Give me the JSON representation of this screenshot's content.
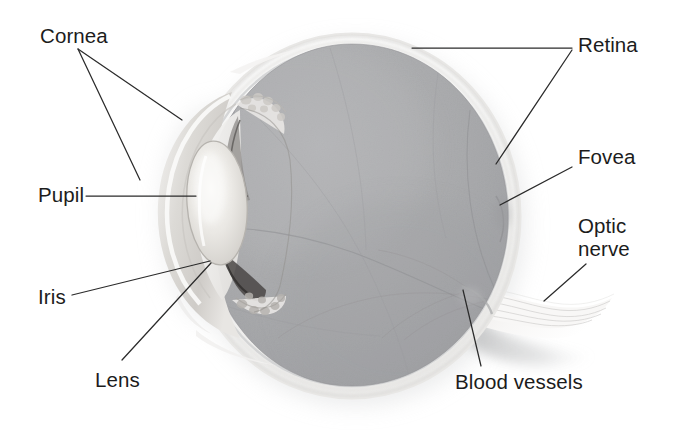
{
  "figure": {
    "type": "anatomical-illustration",
    "background_color": "#ffffff",
    "label_color": "#1c1c1c",
    "leader_line_color": "#2b2b2b"
  },
  "labels": [
    {
      "id": "cornea",
      "text": "Cornea",
      "x": 40,
      "y": 24,
      "align": "left",
      "leader_style": "forked",
      "leader_targets": "corneal dome (outer) and corneal rim (lower)"
    },
    {
      "id": "pupil",
      "text": "Pupil",
      "x": 38,
      "y": 183,
      "align": "left",
      "leader_style": "horizontal",
      "leader_targets": "central aperture of iris"
    },
    {
      "id": "iris",
      "text": "Iris",
      "x": 38,
      "y": 285,
      "align": "left",
      "leader_style": "straight",
      "leader_targets": "pigmented iris margin"
    },
    {
      "id": "lens",
      "text": "Lens",
      "x": 95,
      "y": 368,
      "align": "left",
      "leader_style": "straight",
      "leader_targets": "crystalline lens equator"
    },
    {
      "id": "retina",
      "text": "Retina",
      "x": 578,
      "y": 33,
      "align": "left",
      "leader_style": "forked",
      "leader_targets": "superior retinal wall and posterior retinal wall"
    },
    {
      "id": "fovea",
      "text": "Fovea",
      "x": 578,
      "y": 145,
      "align": "left",
      "leader_style": "straight",
      "leader_targets": "foveal depression at posterior pole"
    },
    {
      "id": "optic-nerve",
      "text": "Optic\nnerve",
      "x": 578,
      "y": 215,
      "align": "left",
      "leader_style": "straight",
      "leader_targets": "optic nerve trunk"
    },
    {
      "id": "blood-vessels",
      "text": "Blood vessels",
      "x": 455,
      "y": 370,
      "align": "left",
      "leader_style": "straight",
      "leader_targets": "vessels at the optic disc"
    }
  ],
  "anatomy": {
    "globe": {
      "center_x": 352,
      "center_y": 216,
      "radius_x": 168,
      "radius_y": 182,
      "vitreous_color": "#a9aaac",
      "sclera_color": "#f3f3f2"
    },
    "lens": {
      "center_x": 216,
      "center_y": 202,
      "color": "#e6e4e0"
    },
    "cornea": {
      "color": "#dedcd9"
    },
    "optic_nerve": {
      "color": "#efeeec"
    }
  }
}
